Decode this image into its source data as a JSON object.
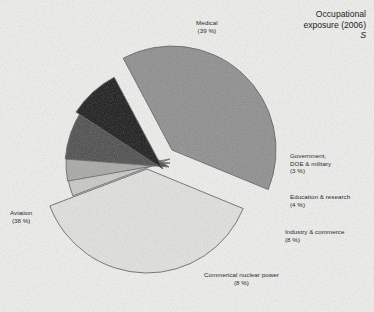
{
  "title": {
    "line1": "Occupational",
    "line2": "exposure (2006)",
    "marker": "S"
  },
  "chart_data": {
    "type": "pie",
    "title": "Occupational exposure (2006)",
    "exploded": true,
    "legend": "none",
    "value_suffix": " %",
    "categories": [
      "Medical",
      "Aviation",
      "Government, DOE & military",
      "Education & research",
      "Industry & commerce",
      "Commerical nuclear power"
    ],
    "values": [
      39,
      38,
      3,
      4,
      8,
      8
    ],
    "labels": [
      {
        "name": "Medical",
        "value": 39,
        "display": "(39 %)",
        "color": "#8d8d8d"
      },
      {
        "name": "Aviation",
        "value": 38,
        "display": "(38 %)",
        "color": "#e2e2e0"
      },
      {
        "name": "Government, DOE & military",
        "value": 3,
        "display": "(3 %)",
        "color": "#c9c9c7",
        "name_line1": "Government,",
        "name_line2": "DOE & military"
      },
      {
        "name": "Education & research",
        "value": 4,
        "display": "(4 %)",
        "color": "#a8a8a6"
      },
      {
        "name": "Industry & commerce",
        "value": 8,
        "display": "(8 %)",
        "color": "#4a4a4a"
      },
      {
        "name": "Commerical nuclear power",
        "value": 8,
        "display": "(8 %)",
        "color": "#161616"
      }
    ]
  },
  "slices": {
    "medical": {
      "label": "Medical",
      "pct": "(39 %)"
    },
    "aviation": {
      "label": "Aviation",
      "pct": "(38 %)"
    },
    "government": {
      "label_line1": "Government,",
      "label_line2": "DOE & military",
      "pct": "(3 %)"
    },
    "education": {
      "label": "Education & research",
      "pct": "(4 %)"
    },
    "industry": {
      "label": "Industry & commerce",
      "pct": "(8 %)"
    },
    "nuclear": {
      "label": "Commerical nuclear power",
      "pct": "(8 %)"
    }
  },
  "colors": {
    "background": "#f0f0ee",
    "medical": "#8d8d8d",
    "aviation": "#e2e2e0",
    "government": "#c9c9c7",
    "education": "#a8a8a6",
    "industry": "#4a4a4a",
    "nuclear": "#161616",
    "outline": "#4d4d4d",
    "text": "#2a2a2a"
  }
}
